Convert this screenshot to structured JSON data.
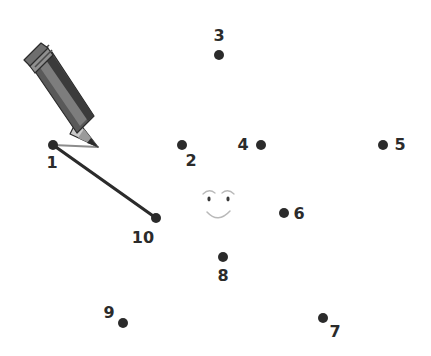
{
  "puzzle": {
    "title": "Connect the dots",
    "background_color": "#ffffff",
    "dot_color": "#2b2b2b",
    "label_color": "#2b2b2b",
    "drawn_line_color": "#2b2b2b",
    "guide_line_color": "#8c8c8c",
    "face_color": "#b9b9b9",
    "dot_radius": 5,
    "dots": [
      {
        "number": "1",
        "cx": 53,
        "cy": 145,
        "label_x": 52,
        "label_y": 163
      },
      {
        "number": "2",
        "cx": 182,
        "cy": 145,
        "label_x": 191,
        "label_y": 161
      },
      {
        "number": "3",
        "cx": 219,
        "cy": 55,
        "label_x": 219,
        "label_y": 36
      },
      {
        "number": "4",
        "cx": 261,
        "cy": 145,
        "label_x": 243,
        "label_y": 145
      },
      {
        "number": "5",
        "cx": 383,
        "cy": 145,
        "label_x": 400,
        "label_y": 145
      },
      {
        "number": "6",
        "cx": 284,
        "cy": 213,
        "label_x": 299,
        "label_y": 214
      },
      {
        "number": "7",
        "cx": 323,
        "cy": 318,
        "label_x": 335,
        "label_y": 332
      },
      {
        "number": "8",
        "cx": 223,
        "cy": 257,
        "label_x": 223,
        "label_y": 276
      },
      {
        "number": "9",
        "cx": 123,
        "cy": 323,
        "label_x": 109,
        "label_y": 313
      },
      {
        "number": "10",
        "cx": 156,
        "cy": 218,
        "label_x": 143,
        "label_y": 238
      }
    ],
    "drawn_segments": [
      {
        "from": "1",
        "to": "10",
        "x1": 53,
        "y1": 145,
        "x2": 156,
        "y2": 218
      }
    ],
    "guide_segment": {
      "from": "1",
      "to": "pencil-tip",
      "x1": 53,
      "y1": 145,
      "x2": 98,
      "y2": 147
    },
    "face": {
      "left_eye_x": 209,
      "left_eye_y": 199,
      "right_eye_x": 228,
      "right_eye_y": 199,
      "eye_rx": 1.6,
      "eye_ry": 2.4,
      "left_brow": "M 203 194 Q 209 188 215 193",
      "right_brow": "M 222 193 Q 228 188 234 194",
      "mouth": "M 207 212 Q 218 224 230 211"
    },
    "pencil": {
      "body_color": "#595959",
      "body_highlight_color": "#7d7d7d",
      "body_shadow_color": "#3b3b3b",
      "ferrule_color": "#8f8f8f",
      "ferrule_band_color": "#4a4a4a",
      "eraser_color": "#6e6e6e",
      "wood_color": "#c9c9c9",
      "wood_shadow_color": "#9a9a9a",
      "graphite_color": "#2b2b2b",
      "outline_color": "#2b2b2b",
      "tip_x": 98,
      "tip_y": 147,
      "tail_x": 24,
      "tail_y": 79
    }
  }
}
